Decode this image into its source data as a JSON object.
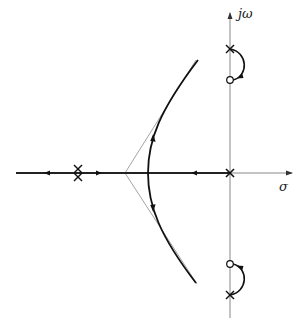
{
  "diagram": {
    "type": "root-locus",
    "axes": {
      "real_label": "σ",
      "imag_label": "jω"
    },
    "poles": [
      {
        "position": "real axis, double pole left",
        "multiplicity": 2
      },
      {
        "position": "origin",
        "multiplicity": 1
      },
      {
        "position": "upper imaginary axis",
        "multiplicity": 1
      },
      {
        "position": "lower imaginary axis",
        "multiplicity": 1
      }
    ],
    "zeros": [
      {
        "position": "upper imaginary axis, below pole"
      },
      {
        "position": "lower imaginary axis, above pole"
      }
    ],
    "asymptotes": {
      "count": 2,
      "style": "thin gray lines from centroid on real axis"
    },
    "branches": [
      "real axis: double pole to left infinity",
      "real axis: double pole to breakaway",
      "real axis: origin pole to breakaway",
      "hyperbolic branch upward toward asymptote",
      "hyperbolic branch downward toward asymptote",
      "arc from upper imaginary pole to upper zero",
      "arc from lower imaginary pole to lower zero"
    ],
    "colors": {
      "locus": "#111111",
      "axis": "#888888",
      "asymptote": "#999999"
    }
  }
}
